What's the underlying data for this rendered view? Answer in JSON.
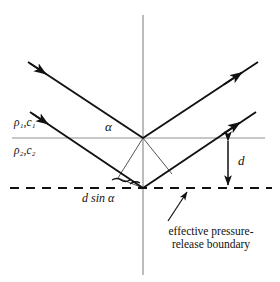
{
  "figure": {
    "type": "acoustics-ray-diagram",
    "background_color": "#ffffff",
    "line_color": "#111111",
    "axis_color": "#8a8a8a"
  },
  "labels": {
    "medium_upper": "ρ₁,c₁",
    "medium_lower": "ρ₂,c₂",
    "angle": "α",
    "depth": "d",
    "path_difference": "d sin α",
    "boundary_line1": "effective pressure-",
    "boundary_line2": "release boundary"
  },
  "geometry": {
    "origin": {
      "x": 143,
      "y": 138
    },
    "lower_vertex": {
      "x": 143,
      "y": 188
    },
    "interface_y": 138,
    "dashed_boundary_y": 188,
    "vertical_axis_x": 143,
    "vertical_axis_top": 15,
    "vertical_axis_bottom": 275,
    "interface_x_start": 12,
    "interface_x_end": 265,
    "dashed_x_start": 10,
    "dashed_x_end": 272,
    "depth_d": 50,
    "rays": [
      {
        "name": "incident-upper",
        "from": {
          "x": 28,
          "y": 62
        },
        "to": {
          "x": 143,
          "y": 138
        },
        "arrow_at": {
          "x": 44,
          "y": 73
        }
      },
      {
        "name": "reflected-upper",
        "from": {
          "x": 143,
          "y": 138
        },
        "to": {
          "x": 258,
          "y": 62
        },
        "arrow_at": {
          "x": 240,
          "y": 74
        }
      },
      {
        "name": "incident-lower",
        "from": {
          "x": 30,
          "y": 112
        },
        "to": {
          "x": 143,
          "y": 188
        },
        "arrow_at": {
          "x": 46,
          "y": 123
        }
      },
      {
        "name": "reflected-lower",
        "from": {
          "x": 143,
          "y": 188
        },
        "to": {
          "x": 256,
          "y": 112
        },
        "arrow_at": {
          "x": 238,
          "y": 124
        }
      }
    ],
    "depth_arrow": {
      "x": 228,
      "y_top": 138,
      "y_bottom": 188
    },
    "callout_arrow": {
      "from": {
        "x": 168,
        "y": 222
      },
      "to": {
        "x": 187,
        "y": 191
      }
    }
  }
}
